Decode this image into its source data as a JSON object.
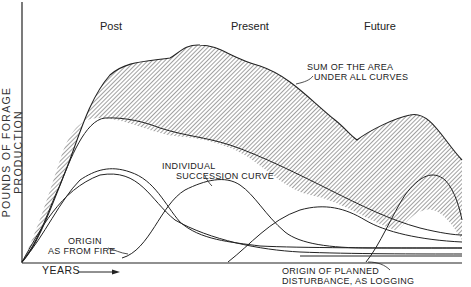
{
  "diagram": {
    "eras": {
      "past": "Post",
      "present": "Present",
      "future": "Future"
    },
    "y_axis_label": "POUNDS OF FORAGE PRODUCTION",
    "x_axis_label": "YEARS",
    "annotations": {
      "sum_line1": "SUM OF THE AREA",
      "sum_line2": "UNDER ALL CURVES",
      "individual_line1": "INDIVIDUAL",
      "individual_line2": "SUCCESSION CURVE",
      "fire_line1": "ORIGIN",
      "fire_line2": "AS FROM FIRE",
      "logging_line1": "ORIGIN OF PLANNED",
      "logging_line2": "DISTURBANCE, AS LOGGING"
    },
    "colors": {
      "ink": "#222222",
      "background": "#ffffff",
      "hatch": "#444444"
    }
  }
}
